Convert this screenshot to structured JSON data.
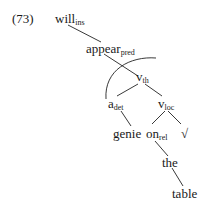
{
  "example_number": "(73)",
  "nodes": {
    "will": {
      "word": "will",
      "sub": "ins"
    },
    "appear": {
      "word": "appear",
      "sub": "pred"
    },
    "v_th": {
      "word": "v",
      "sub": "th"
    },
    "a_det": {
      "word": "a",
      "sub": "det"
    },
    "v_loc": {
      "word": "v",
      "sub": "loc"
    },
    "genie": {
      "word": "genie",
      "sub": ""
    },
    "on": {
      "word": "on",
      "sub": "rel"
    },
    "root": {
      "word": "√",
      "sub": ""
    },
    "the": {
      "word": "the",
      "sub": ""
    },
    "table": {
      "word": "table",
      "sub": ""
    }
  },
  "edges": [
    [
      "will",
      "appear"
    ],
    [
      "appear",
      "v_th"
    ],
    [
      "v_th",
      "a_det"
    ],
    [
      "v_th",
      "v_loc"
    ],
    [
      "a_det",
      "genie"
    ],
    [
      "v_loc",
      "on"
    ],
    [
      "v_loc",
      "root"
    ],
    [
      "on",
      "the"
    ],
    [
      "the",
      "table"
    ]
  ],
  "arc": {
    "from": "a_det",
    "to": "v_th",
    "description": "curved movement arc from a_det up over v_th"
  }
}
